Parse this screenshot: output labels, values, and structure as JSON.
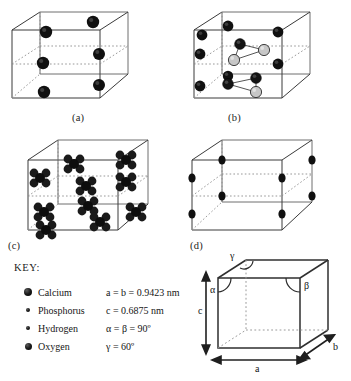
{
  "figure": {
    "panels": [
      {
        "id": "a",
        "label": "(a)",
        "caption_species": "Calcium"
      },
      {
        "id": "b",
        "label": "(b)",
        "caption_species": "Calcium and Phosphorus"
      },
      {
        "id": "c",
        "label": "(c)",
        "caption_species": "Phosphate groups"
      },
      {
        "id": "d",
        "label": "(d)",
        "caption_species": "Hydroxyl"
      }
    ]
  },
  "key": {
    "title": "KEY:",
    "entries": [
      {
        "marker": "calcium",
        "label": "Calcium"
      },
      {
        "marker": "phosphorus",
        "label": "Phosphorus"
      },
      {
        "marker": "hydrogen",
        "label": "Hydrogen"
      },
      {
        "marker": "oxygen",
        "label": "Oxygen"
      }
    ]
  },
  "parameters": [
    {
      "text": "a = b = 0.9423 nm"
    },
    {
      "text": "c = 0.6875 nm"
    },
    {
      "text": "α = β = 90º"
    },
    {
      "text": "γ = 60º"
    }
  ],
  "cube_diagram": {
    "edge_labels": {
      "a": "a",
      "b": "b",
      "c": "c"
    },
    "angle_labels": {
      "alpha": "α",
      "beta": "β",
      "gamma": "γ"
    }
  },
  "colors": {
    "atom_dark": "#111111",
    "atom_light": "#c9c9c9",
    "edge": "#3a3a3a",
    "hidden_edge": "#8a8a8a",
    "background": "#ffffff"
  }
}
